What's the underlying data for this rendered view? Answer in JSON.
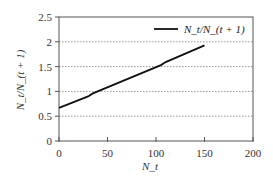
{
  "chart_data": {
    "type": "line",
    "title": "",
    "xlabel": "N_t",
    "ylabel": "N_t/N_(t + 1)",
    "xlim": [
      0,
      200
    ],
    "ylim": [
      0,
      2.5
    ],
    "xticks": [
      0,
      50,
      100,
      150,
      200
    ],
    "yticks": [
      0,
      0.5,
      1,
      1.5,
      2,
      2.5
    ],
    "xtick_labels": [
      "0",
      "50",
      "100",
      "150",
      "200"
    ],
    "ytick_labels": [
      "0",
      "0.5",
      "1",
      "1.5",
      "2",
      "2.5"
    ],
    "grid": "horizontal dotted",
    "legend_position": "upper right",
    "series": [
      {
        "name": "N_t/N_(t + 1)",
        "color": "#111111",
        "x": [
          0,
          30,
          35,
          105,
          110,
          150
        ],
        "y": [
          0.67,
          0.9,
          0.96,
          1.53,
          1.59,
          1.93
        ]
      }
    ]
  }
}
